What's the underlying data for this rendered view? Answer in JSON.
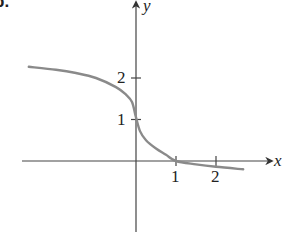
{
  "panel_label": "b.",
  "chart_data": {
    "type": "line",
    "title": "",
    "xlabel": "x",
    "ylabel": "y",
    "x_ticks": [
      1,
      2
    ],
    "y_ticks": [
      1,
      2
    ],
    "x_tick_labels": [
      "1",
      "2"
    ],
    "y_tick_labels": [
      "1",
      "2"
    ],
    "xlim": [
      -2.85,
      3.4
    ],
    "ylim": [
      -1.75,
      3.9
    ],
    "grid": false,
    "legend": null,
    "series": [
      {
        "name": "curve",
        "color": "#8a8a8a",
        "x": [
          -2.68,
          -2.0,
          -1.5,
          -1.0,
          -0.5,
          -0.25,
          -0.1,
          0.0,
          0.1,
          0.25,
          0.5,
          0.75,
          1.0,
          1.5,
          2.0,
          2.68
        ],
        "y": [
          2.27,
          2.2,
          2.12,
          2.0,
          1.78,
          1.6,
          1.42,
          1.05,
          0.72,
          0.5,
          0.3,
          0.15,
          0.0,
          -0.08,
          -0.14,
          -0.2
        ]
      }
    ],
    "annotations": [
      {
        "text": "y",
        "position": "top of y-axis"
      },
      {
        "text": "x",
        "position": "right end of x-axis"
      }
    ]
  }
}
